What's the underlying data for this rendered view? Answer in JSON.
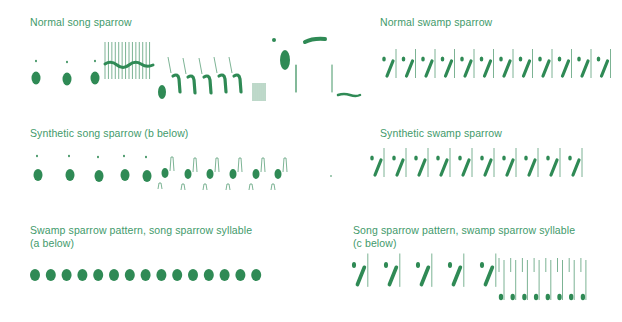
{
  "figure": {
    "colors": {
      "title": "#3f9a6b",
      "ink": "#2f8a55",
      "thin": "#5a9f78",
      "background": "#ffffff"
    },
    "panels": [
      {
        "id": "normal-song",
        "title": "Normal song sparrow",
        "x": 30,
        "y": 16
      },
      {
        "id": "normal-swamp",
        "title": "Normal swamp sparrow",
        "x": 380,
        "y": 16
      },
      {
        "id": "synthetic-song",
        "title": "Synthetic song sparrow (b below)",
        "x": 30,
        "y": 127
      },
      {
        "id": "synthetic-swamp",
        "title": "Synthetic swamp sparrow",
        "x": 380,
        "y": 127
      },
      {
        "id": "swamp-pattern-song-syllable",
        "title": "Swamp sparrow pattern, song sparrow syllable\n(a below)",
        "x": 30,
        "y": 224
      },
      {
        "id": "song-pattern-swamp-syllable",
        "title": "Song sparrow pattern, swamp sparrow syllable\n(c below)",
        "x": 353,
        "y": 224
      }
    ],
    "syllables": {
      "normal_song_intro_notes": [
        {
          "x": 36,
          "y": 78
        },
        {
          "x": 67,
          "y": 79
        },
        {
          "x": 95,
          "y": 78
        }
      ],
      "normal_song_trill_buzz": {
        "x": 105,
        "y": 42,
        "width": 48,
        "height": 37,
        "lines": 14
      },
      "normal_song_hooks": [
        {
          "x": 178,
          "y": 85
        },
        {
          "x": 193,
          "y": 86
        },
        {
          "x": 209,
          "y": 86
        },
        {
          "x": 224,
          "y": 85
        },
        {
          "x": 239,
          "y": 85
        }
      ],
      "normal_song_swamp_count": 12,
      "synthetic_song_dots": [
        {
          "x": 38,
          "y": 175
        },
        {
          "x": 70,
          "y": 175
        },
        {
          "x": 99,
          "y": 176
        },
        {
          "x": 125,
          "y": 175
        },
        {
          "x": 147,
          "y": 176
        }
      ],
      "synthetic_song_small_dots": [
        {
          "x": 165,
          "y": 173
        },
        {
          "x": 188,
          "y": 174
        },
        {
          "x": 210,
          "y": 174
        },
        {
          "x": 233,
          "y": 174
        },
        {
          "x": 256,
          "y": 174
        },
        {
          "x": 278,
          "y": 174
        }
      ],
      "synthetic_swamp_count": 10,
      "swamp_pattern_blobs": 15,
      "song_pattern_large": 5,
      "song_pattern_small": 8
    }
  }
}
